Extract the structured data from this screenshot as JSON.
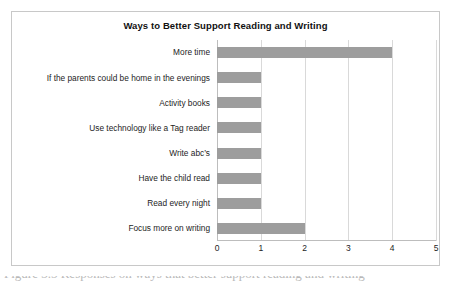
{
  "figure": {
    "title": "Ways to Better Support Reading and Writing",
    "caption_partial": "Figure 3.5  Responses on ways that better support reading and writing"
  },
  "chart_data": {
    "type": "bar",
    "orientation": "horizontal",
    "title": "Ways to Better Support Reading and Writing",
    "xlabel": "",
    "ylabel": "",
    "xlim": [
      0,
      5
    ],
    "xticks": [
      "0",
      "1",
      "2",
      "3",
      "4",
      "5"
    ],
    "grid": true,
    "legend": "none",
    "bar_color": "#9d9d9d",
    "categories": [
      "More time",
      "If the parents could be home in the evenings",
      "Activity books",
      "Use technology like a Tag reader",
      "Write abc’s",
      "Have the child read",
      "Read every night",
      "Focus more on writing"
    ],
    "values": [
      4,
      1,
      1,
      1,
      1,
      1,
      1,
      2
    ]
  }
}
